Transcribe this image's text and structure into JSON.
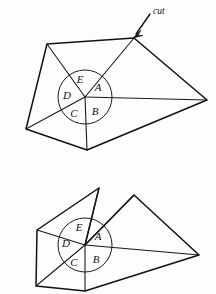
{
  "page": {
    "background_color": "#fdfdfd",
    "ink_color": "#111111",
    "width": 216,
    "height": 294
  },
  "annotations": {
    "cut_label": "cut",
    "cut_arrow": "arrow-pointing-down-left"
  },
  "figures": [
    {
      "id": "figure-top",
      "caption": "Polygon before cut",
      "center_vertex": {
        "x": 85,
        "y": 97
      },
      "angle_circle": {
        "cx": 85,
        "cy": 97,
        "r": 27
      },
      "angle_labels": [
        {
          "name": "A",
          "x": 98,
          "y": 91
        },
        {
          "name": "B",
          "x": 95,
          "y": 115
        },
        {
          "name": "C",
          "x": 74,
          "y": 117
        },
        {
          "name": "D",
          "x": 67,
          "y": 99
        },
        {
          "name": "E",
          "x": 80,
          "y": 83
        }
      ],
      "outline_vertices": [
        {
          "x": 47,
          "y": 44
        },
        {
          "x": 134,
          "y": 38
        },
        {
          "x": 207,
          "y": 100
        },
        {
          "x": 87,
          "y": 150
        },
        {
          "x": 26,
          "y": 129
        }
      ],
      "spokes": [
        {
          "to_x": 47,
          "to_y": 44
        },
        {
          "to_x": 134,
          "to_y": 38
        },
        {
          "to_x": 207,
          "to_y": 100
        },
        {
          "to_x": 87,
          "to_y": 150
        },
        {
          "to_x": 26,
          "to_y": 129
        }
      ]
    },
    {
      "id": "figure-bottom",
      "caption": "Polygon after cut is opened",
      "center_vertex": {
        "x": 85,
        "y": 245
      },
      "angle_circle": {
        "cx": 85,
        "cy": 245,
        "r": 27
      },
      "angle_labels": [
        {
          "name": "A",
          "x": 98,
          "y": 240
        },
        {
          "name": "B",
          "x": 96,
          "y": 263
        },
        {
          "name": "C",
          "x": 74,
          "y": 266
        },
        {
          "name": "D",
          "x": 66,
          "y": 247
        },
        {
          "name": "E",
          "x": 79,
          "y": 231
        }
      ],
      "outline_vertices": [
        {
          "x": 37,
          "y": 230
        },
        {
          "x": 99,
          "y": 188
        },
        {
          "x": 134,
          "y": 195
        },
        {
          "x": 199,
          "y": 255
        },
        {
          "x": 85,
          "y": 291
        },
        {
          "x": 36,
          "y": 286
        }
      ],
      "spokes": [
        {
          "to_x": 37,
          "to_y": 230
        },
        {
          "to_x": 99,
          "to_y": 188
        },
        {
          "to_x": 134,
          "to_y": 195
        },
        {
          "to_x": 199,
          "to_y": 255
        },
        {
          "to_x": 85,
          "to_y": 291
        },
        {
          "to_x": 36,
          "to_y": 286
        }
      ]
    }
  ]
}
